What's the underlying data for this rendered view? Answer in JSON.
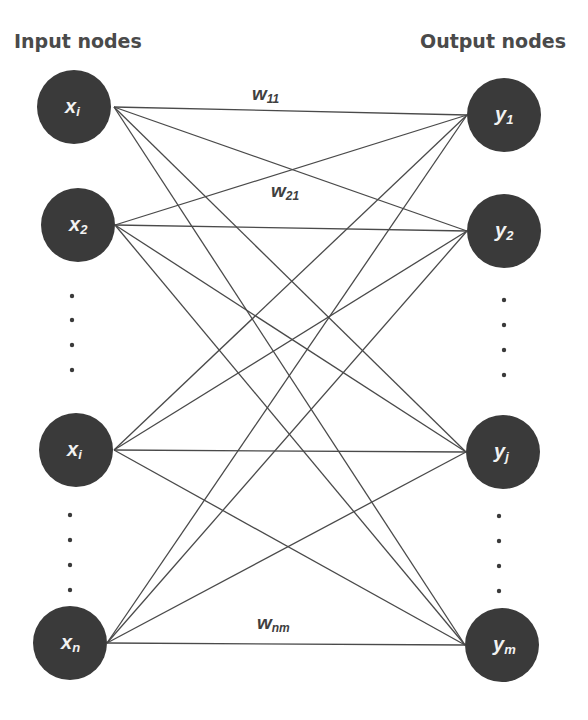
{
  "titles": {
    "input": "Input nodes",
    "output": "Output nodes"
  },
  "colors": {
    "node_fill": "#3a3a3a",
    "node_text": "#f2f2f2",
    "edge": "#4a4a4a",
    "title_text": "#4a4a4a"
  },
  "input_nodes": [
    {
      "base": "x",
      "sub": "i",
      "cx": 74,
      "cy": 107,
      "r": 37,
      "anchor_x": 114
    },
    {
      "base": "x",
      "sub": "2",
      "cx": 78,
      "cy": 225,
      "r": 37,
      "anchor_x": 115
    },
    {
      "base": "x",
      "sub": "i",
      "cx": 76,
      "cy": 450,
      "r": 37,
      "anchor_x": 114
    },
    {
      "base": "x",
      "sub": "n",
      "cx": 70,
      "cy": 643,
      "r": 37,
      "anchor_x": 107
    }
  ],
  "output_nodes": [
    {
      "base": "y",
      "sub": "1",
      "cx": 504,
      "cy": 115,
      "r": 37,
      "anchor_x": 467
    },
    {
      "base": "y",
      "sub": "2",
      "cx": 504,
      "cy": 231,
      "r": 37,
      "anchor_x": 467
    },
    {
      "base": "y",
      "sub": "j",
      "cx": 503,
      "cy": 452,
      "r": 37,
      "anchor_x": 466
    },
    {
      "base": "y",
      "sub": "m",
      "cx": 502,
      "cy": 645,
      "r": 37,
      "anchor_x": 465
    }
  ],
  "weights": [
    {
      "base": "w",
      "sub": "11",
      "x": 252,
      "y": 100,
      "italic": true
    },
    {
      "base": "w",
      "sub": "21",
      "x": 271,
      "y": 197,
      "italic": false
    },
    {
      "base": "w",
      "sub": "nm",
      "x": 257,
      "y": 629,
      "italic": true
    }
  ],
  "ellipsis_dots": {
    "input": [
      {
        "x": 72,
        "y": 296
      },
      {
        "x": 72,
        "y": 320
      },
      {
        "x": 72,
        "y": 345
      },
      {
        "x": 72,
        "y": 370
      },
      {
        "x": 70,
        "y": 515
      },
      {
        "x": 70,
        "y": 540
      },
      {
        "x": 70,
        "y": 565
      },
      {
        "x": 70,
        "y": 590
      }
    ],
    "output": [
      {
        "x": 504,
        "y": 300
      },
      {
        "x": 504,
        "y": 325
      },
      {
        "x": 504,
        "y": 350
      },
      {
        "x": 504,
        "y": 375
      },
      {
        "x": 499,
        "y": 516
      },
      {
        "x": 499,
        "y": 541
      },
      {
        "x": 499,
        "y": 566
      },
      {
        "x": 499,
        "y": 591
      }
    ]
  },
  "connectivity": "fully-connected"
}
